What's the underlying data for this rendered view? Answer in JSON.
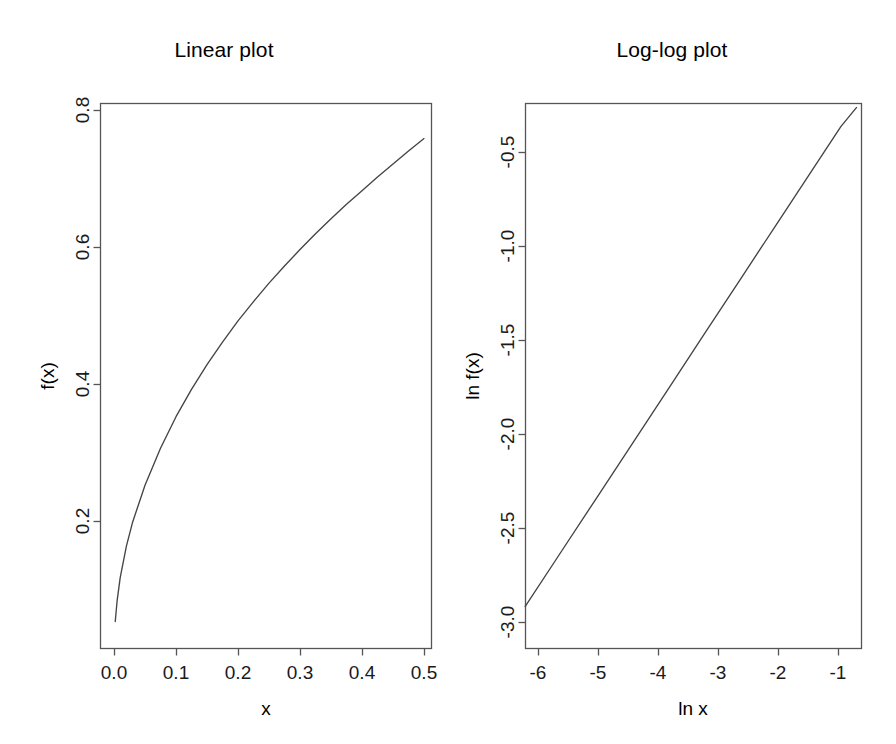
{
  "figure": {
    "background": "#ffffff",
    "line_color": "#444444",
    "axis_color": "#555555",
    "text_color": "#000000",
    "panels": 2
  },
  "panels": [
    {
      "id": "linear",
      "title": "Linear plot",
      "xlabel": "x",
      "ylabel": "f(x)",
      "xticks": [
        "0.0",
        "0.1",
        "0.2",
        "0.3",
        "0.4",
        "0.5"
      ],
      "yticks": [
        "0.2",
        "0.4",
        "0.6",
        "0.8"
      ]
    },
    {
      "id": "loglog",
      "title": "Log-log plot",
      "xlabel": "ln x",
      "ylabel": "ln f(x)",
      "xticks": [
        "-6",
        "-5",
        "-4",
        "-3",
        "-2",
        "-1"
      ],
      "yticks": [
        "-0.5",
        "-1.0",
        "-1.5",
        "-2.0",
        "-2.5",
        "-3.0"
      ]
    }
  ],
  "chart_data": [
    {
      "type": "line",
      "id": "linear",
      "title": "Linear plot",
      "xlabel": "x",
      "ylabel": "f(x)",
      "xlim": [
        0.0,
        0.5
      ],
      "ylim": [
        0.0,
        0.8
      ],
      "xticks": [
        0.0,
        0.1,
        0.2,
        0.3,
        0.4,
        0.5
      ],
      "yticks": [
        0.2,
        0.4,
        0.6,
        0.8
      ],
      "grid": false,
      "legend": "none",
      "note": "Power law f(x) = 1.105 * x^0.485 plotted on linear axes; concave increasing curve.",
      "x": [
        0.002,
        0.005,
        0.01,
        0.02,
        0.03,
        0.05,
        0.075,
        0.1,
        0.125,
        0.15,
        0.175,
        0.2,
        0.225,
        0.25,
        0.275,
        0.3,
        0.325,
        0.35,
        0.375,
        0.4,
        0.425,
        0.45,
        0.475,
        0.5
      ],
      "y": [
        0.054,
        0.084,
        0.118,
        0.164,
        0.199,
        0.253,
        0.307,
        0.353,
        0.393,
        0.429,
        0.462,
        0.493,
        0.521,
        0.548,
        0.573,
        0.597,
        0.62,
        0.642,
        0.663,
        0.683,
        0.703,
        0.722,
        0.741,
        0.759
      ]
    },
    {
      "type": "line",
      "id": "loglog",
      "title": "Log-log plot",
      "xlabel": "ln x",
      "ylabel": "ln f(x)",
      "xlim": [
        -6.25,
        -0.65
      ],
      "ylim": [
        -3.15,
        -0.25
      ],
      "xticks": [
        -6,
        -5,
        -4,
        -3,
        -2,
        -1
      ],
      "yticks": [
        -0.5,
        -1.0,
        -1.5,
        -2.0,
        -2.5,
        -3.0
      ],
      "grid": false,
      "legend": "none",
      "note": "Straight line of slope ~0.485, intercept ~0.10; confirms power-law behaviour.",
      "x": [
        -6.215,
        -5.6,
        -5.0,
        -4.4,
        -3.8,
        -3.2,
        -2.6,
        -2.0,
        -1.6,
        -1.2,
        -0.95,
        -0.693
      ],
      "y": [
        -2.915,
        -2.617,
        -2.326,
        -2.035,
        -1.744,
        -1.452,
        -1.161,
        -0.87,
        -0.676,
        -0.482,
        -0.361,
        -0.261
      ]
    }
  ]
}
